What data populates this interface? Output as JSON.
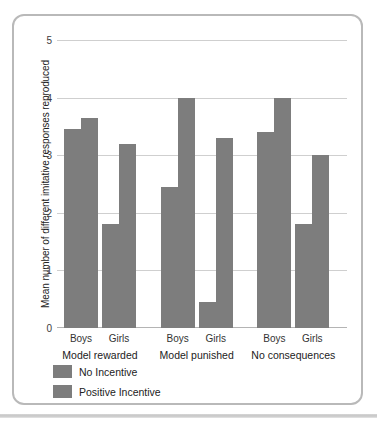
{
  "chart_data": {
    "type": "bar",
    "title": "",
    "subtitle": "",
    "xlabel": "",
    "ylabel": "Mean number of different imitative responses reproduced",
    "ylim": [
      0,
      5
    ],
    "yticks": [
      "0",
      "1",
      "2",
      "3",
      "4",
      "5"
    ],
    "grid": true,
    "legend_position": "bottom-left",
    "bar_color": "#7d7d7d",
    "groups": [
      "Model rewarded",
      "Model punished",
      "No consequences"
    ],
    "subgroups": [
      "Boys",
      "Girls"
    ],
    "categories": [
      "Model rewarded / Boys",
      "Model rewarded / Girls",
      "Model punished / Boys",
      "Model punished / Girls",
      "No consequences / Boys",
      "No consequences / Girls"
    ],
    "series": [
      {
        "name": "No Incentive",
        "color": "#7d7d7d",
        "values": [
          3.45,
          1.8,
          2.45,
          0.45,
          3.4,
          1.8
        ]
      },
      {
        "name": "Positive Incentive",
        "color": "#7d7d7d",
        "values": [
          3.65,
          3.2,
          4.0,
          3.3,
          4.0,
          3.0
        ]
      }
    ]
  },
  "axis": {
    "y_label": "Mean number of different imitative responses reproduced",
    "y_ticks": [
      "5",
      "4",
      "3",
      "2",
      "1",
      "0"
    ]
  },
  "group_labels": [
    {
      "label": "Model rewarded"
    },
    {
      "label": "Model punished"
    },
    {
      "label": "No consequences"
    }
  ],
  "sex_labels": [
    {
      "label": "Boys"
    },
    {
      "label": "Girls"
    },
    {
      "label": "Boys"
    },
    {
      "label": "Girls"
    },
    {
      "label": "Boys"
    },
    {
      "label": "Girls"
    }
  ],
  "legend": {
    "items": [
      {
        "label": "No Incentive",
        "color": "#7d7d7d"
      },
      {
        "label": "Positive Incentive",
        "color": "#7d7d7d"
      }
    ]
  }
}
